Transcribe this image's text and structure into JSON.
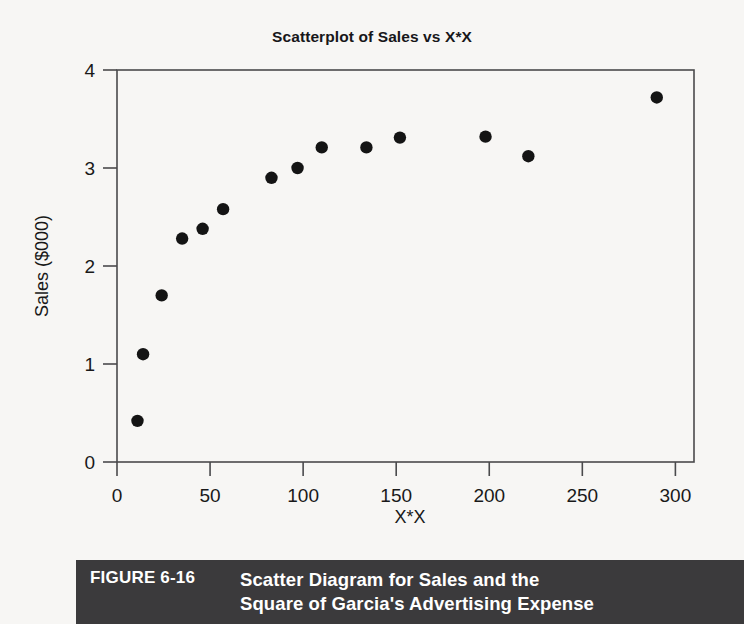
{
  "figure": {
    "number_label": "FIGURE 6-16",
    "caption": "Scatter Diagram for Sales and the\nSquare of Garcia's Advertising Expense"
  },
  "chart_data": {
    "type": "scatter",
    "title": "Scatterplot of Sales vs X*X",
    "xlabel": "X*X",
    "ylabel": "Sales ($000)",
    "xlim": [
      0,
      310
    ],
    "ylim": [
      0,
      4
    ],
    "xticks": [
      0,
      50,
      100,
      150,
      200,
      250,
      300
    ],
    "xtick_labels": [
      "0",
      "50",
      "100",
      "150",
      "200",
      "250",
      "300"
    ],
    "yticks": [
      0,
      1,
      2,
      3,
      4
    ],
    "ytick_labels": [
      "0",
      "1",
      "2",
      "3",
      "4"
    ],
    "grid": false,
    "legend": null,
    "marker": "filled-circle",
    "marker_color": "#141414",
    "points": [
      {
        "x": 11,
        "y": 0.42
      },
      {
        "x": 14,
        "y": 1.1
      },
      {
        "x": 24,
        "y": 1.7
      },
      {
        "x": 35,
        "y": 2.28
      },
      {
        "x": 46,
        "y": 2.38
      },
      {
        "x": 57,
        "y": 2.58
      },
      {
        "x": 83,
        "y": 2.9
      },
      {
        "x": 97,
        "y": 3.0
      },
      {
        "x": 110,
        "y": 3.21
      },
      {
        "x": 134,
        "y": 3.21
      },
      {
        "x": 152,
        "y": 3.31
      },
      {
        "x": 198,
        "y": 3.32
      },
      {
        "x": 221,
        "y": 3.12
      },
      {
        "x": 290,
        "y": 3.72
      }
    ]
  }
}
